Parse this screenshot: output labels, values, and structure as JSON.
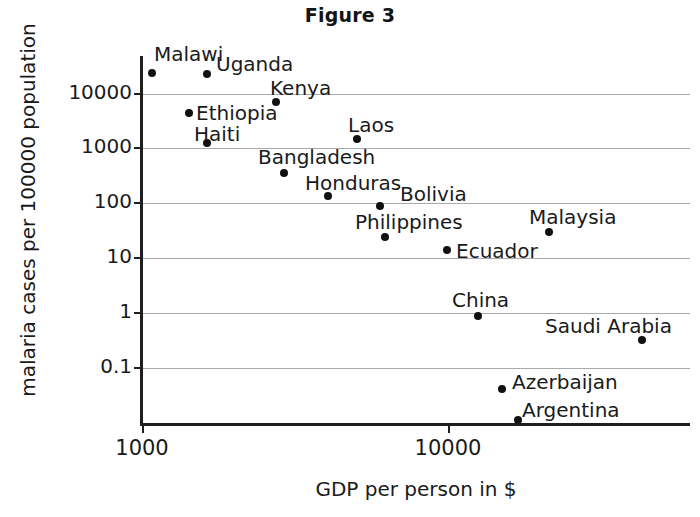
{
  "chart_data": {
    "type": "scatter",
    "title": "Figure 3",
    "xlabel": "GDP per person in $",
    "ylabel": "malaria cases per 100000 population",
    "xscale": "log",
    "yscale": "log",
    "xlim": [
      900,
      47000
    ],
    "ylim": [
      0.012,
      42000
    ],
    "grid": true,
    "legend": "none",
    "xticks": [
      "1000",
      "10000"
    ],
    "xtick_values": [
      1000,
      10000
    ],
    "yticks": [
      "10000",
      "1000",
      "100",
      "10",
      "1",
      "0.1"
    ],
    "ytick_values": [
      10000,
      1000,
      100,
      10,
      1,
      0.1
    ],
    "point_color": "#111111",
    "grid_color": "#9a9a9a",
    "axis_color": "#1f1f1f",
    "points": [
      {
        "label": "Malawi",
        "x": 1010,
        "y": 22000,
        "px": 152,
        "py": 73,
        "lx": 154,
        "ly": 42,
        "anchor": "left"
      },
      {
        "label": "Uganda",
        "x": 1700,
        "y": 20000,
        "px": 207,
        "py": 74,
        "lx": 216,
        "ly": 52,
        "anchor": "left"
      },
      {
        "label": "Kenya",
        "x": 2700,
        "y": 7800,
        "px": 276,
        "py": 102,
        "lx": 270,
        "ly": 76,
        "anchor": "left"
      },
      {
        "label": "Ethiopia",
        "x": 1410,
        "y": 4200,
        "px": 189,
        "py": 113,
        "lx": 196,
        "ly": 101,
        "anchor": "left"
      },
      {
        "label": "Haiti",
        "x": 1700,
        "y": 1250,
        "px": 207,
        "py": 143,
        "lx": 194,
        "ly": 122,
        "anchor": "left"
      },
      {
        "label": "Laos",
        "x": 5100,
        "y": 1600,
        "px": 357,
        "py": 139,
        "lx": 348,
        "ly": 113,
        "anchor": "left"
      },
      {
        "label": "Bangladesh",
        "x": 2950,
        "y": 380,
        "px": 284,
        "py": 173,
        "lx": 258,
        "ly": 145,
        "anchor": "left"
      },
      {
        "label": "Honduras",
        "x": 4000,
        "y": 150,
        "px": 328,
        "py": 196,
        "lx": 305,
        "ly": 171,
        "anchor": "left"
      },
      {
        "label": "Bolivia",
        "x": 5900,
        "y": 96,
        "px": 380,
        "py": 206,
        "lx": 400,
        "ly": 182,
        "anchor": "left"
      },
      {
        "label": "Philippines",
        "x": 6100,
        "y": 24,
        "px": 385,
        "py": 237,
        "lx": 355,
        "ly": 210,
        "anchor": "left"
      },
      {
        "label": "Malaysia",
        "x": 17000,
        "y": 33,
        "px": 549,
        "py": 232,
        "lx": 529,
        "ly": 205,
        "anchor": "left"
      },
      {
        "label": "Ecuador",
        "x": 10800,
        "y": 14,
        "px": 447,
        "py": 250,
        "lx": 456,
        "ly": 239,
        "anchor": "left"
      },
      {
        "label": "China",
        "x": 12800,
        "y": 0.95,
        "px": 478,
        "py": 316,
        "lx": 452,
        "ly": 288,
        "anchor": "left"
      },
      {
        "label": "Saudi Arabia",
        "x": 38000,
        "y": 0.35,
        "px": 642,
        "py": 340,
        "lx": 545,
        "ly": 314,
        "anchor": "left"
      },
      {
        "label": "Azerbaijan",
        "x": 15500,
        "y": 0.045,
        "px": 502,
        "py": 389,
        "lx": 512,
        "ly": 370,
        "anchor": "left"
      },
      {
        "label": "Argentina",
        "x": 17700,
        "y": 0.018,
        "px": 518,
        "py": 420,
        "lx": 522,
        "ly": 398,
        "anchor": "left"
      }
    ]
  }
}
